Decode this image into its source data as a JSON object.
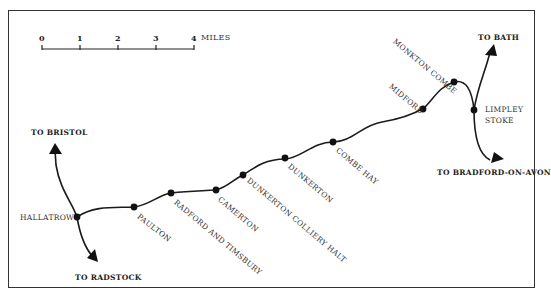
{
  "map": {
    "title": "",
    "line_color": "#1a1a1a",
    "scale": {
      "ticks": [
        "0",
        "1",
        "2",
        "3",
        "4"
      ],
      "unit": "MILES"
    },
    "destinations": {
      "bath": "TO BATH",
      "bristol": "TO BRISTOL",
      "radstock": "TO RADSTOCK",
      "bradford": "TO BRADFORD-ON-AVON"
    },
    "stations": [
      {
        "name": "HALLATROW"
      },
      {
        "name": "PAULTON"
      },
      {
        "name": "RADFORD AND TIMSBURY"
      },
      {
        "name": "CAMERTON"
      },
      {
        "name": "DUNKERTON COLLIERY HALT"
      },
      {
        "name": "DUNKERTON"
      },
      {
        "name": "COMBE HAY"
      },
      {
        "name": "MIDFORD"
      },
      {
        "name": "MONKTON COMBE"
      },
      {
        "name": "LIMPLEY"
      },
      {
        "name": "STOKE"
      }
    ]
  }
}
